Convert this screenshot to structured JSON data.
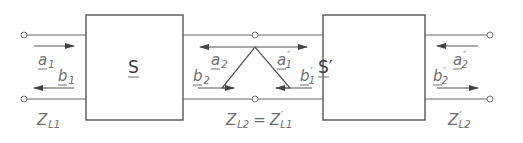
{
  "diagram": {
    "type": "cascaded two-port scattering network",
    "blocks": [
      {
        "id": "S",
        "label": "S"
      },
      {
        "id": "S_prime",
        "label": "S′"
      }
    ],
    "wave_labels": {
      "a1": {
        "base": "a",
        "sub": "1"
      },
      "b1": {
        "base": "b",
        "sub": "1"
      },
      "a2": {
        "base": "a",
        "sub": "2"
      },
      "b2": {
        "base": "b",
        "sub": "2"
      },
      "a1p": {
        "base": "a",
        "sub": "1",
        "prime": "′"
      },
      "b1p": {
        "base": "b",
        "sub": "1",
        "prime": "′"
      },
      "a2p": {
        "base": "a",
        "sub": "2",
        "prime": "′"
      },
      "b2p": {
        "base": "b",
        "sub": "2",
        "prime": "′"
      }
    },
    "impedance_labels": {
      "zl1": {
        "base": "Z",
        "sub": "L1"
      },
      "zl2_eq": {
        "left": "Z",
        "left_sub": "L2",
        "eq": "=",
        "right": "Z",
        "right_prime": "′",
        "right_sub": "L1"
      },
      "zl2p": {
        "base": "Z",
        "prime": "′",
        "sub": "L2"
      }
    }
  }
}
